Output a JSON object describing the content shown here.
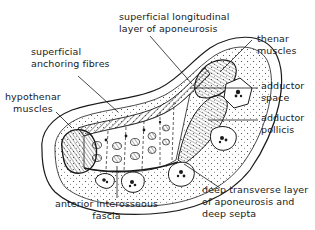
{
  "diagram": {
    "type": "anatomical cross-section",
    "labels": {
      "superficial_longitudinal": [
        "superficial longitudinal",
        "layer of aponeurosis"
      ],
      "superficial_anchoring": [
        "superficial",
        "anchoring fibres"
      ],
      "hypothenar": [
        "hypothenar",
        "muscles"
      ],
      "thenar": [
        "thenar",
        "muscles"
      ],
      "adductor_space": [
        "adductor",
        "space"
      ],
      "adductor_pollicis": [
        "adductor",
        "pollicis"
      ],
      "anterior_interosseous": [
        "anterior interosseous",
        "fascia"
      ],
      "deep_transverse": [
        "deep transverse layer",
        "of aponeurosis and",
        "deep septa"
      ]
    },
    "colors": {
      "ink": "#1a1a1a",
      "background": "#ffffff"
    }
  }
}
